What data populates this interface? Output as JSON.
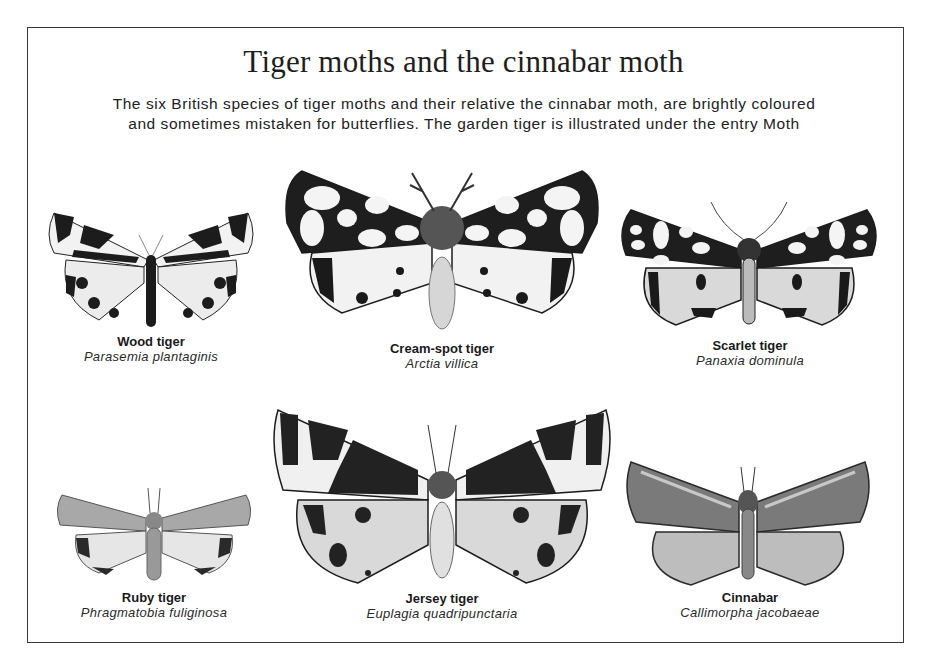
{
  "page": {
    "title": "Tiger moths and the cinnabar moth",
    "intro_lines": [
      "The six British species of tiger moths and their relative the cinnabar moth, are brightly coloured",
      "and sometimes mistaken for butterflies. The garden tiger is illustrated under the entry Moth"
    ]
  },
  "species": [
    {
      "common": "Wood tiger",
      "latin": "Parasemia plantaginis",
      "icon": "wood-tiger-illustration"
    },
    {
      "common": "Cream-spot tiger",
      "latin": "Arctia villica",
      "icon": "cream-spot-tiger-illustration"
    },
    {
      "common": "Scarlet tiger",
      "latin": "Panaxia dominula",
      "icon": "scarlet-tiger-illustration"
    },
    {
      "common": "Ruby tiger",
      "latin": "Phragmatobia fuliginosa",
      "icon": "ruby-tiger-illustration"
    },
    {
      "common": "Jersey tiger",
      "latin": "Euplagia quadripunctaria",
      "icon": "jersey-tiger-illustration"
    },
    {
      "common": "Cinnabar",
      "latin": "Callimorpha jacobaeae",
      "icon": "cinnabar-illustration"
    }
  ]
}
